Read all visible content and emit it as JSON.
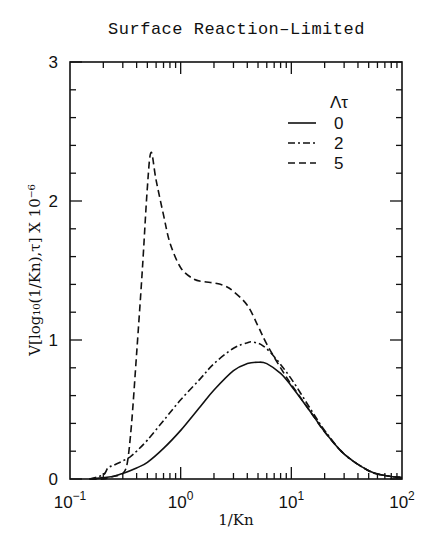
{
  "chart_data": {
    "type": "line",
    "title": "Surface Reaction–Limited",
    "xlabel": "1/Kn",
    "ylabel": "V[log₁₀(1/Kn),τ]  X  10⁻⁶",
    "xscale": "log",
    "xlim": [
      0.1,
      100
    ],
    "ylim": [
      0,
      3
    ],
    "x_ticks": [
      {
        "value": 0.1,
        "label_base": "10",
        "label_exp": "−1"
      },
      {
        "value": 1,
        "label_base": "10",
        "label_exp": "0"
      },
      {
        "value": 10,
        "label_base": "10",
        "label_exp": "1"
      },
      {
        "value": 100,
        "label_base": "10",
        "label_exp": "2"
      }
    ],
    "y_ticks": [
      0,
      1,
      2,
      3
    ],
    "y_minor_step": 0.2,
    "grid": false,
    "legend": {
      "title": "Λτ",
      "position": "upper right",
      "entries": [
        {
          "label": "0",
          "style": "solid"
        },
        {
          "label": "2",
          "style": "dashdot"
        },
        {
          "label": "5",
          "style": "dashed"
        }
      ]
    },
    "series": [
      {
        "name": "Λτ = 0",
        "style": "solid",
        "x": [
          0.15,
          0.2,
          0.25,
          0.3,
          0.4,
          0.5,
          0.7,
          1.0,
          1.5,
          2.0,
          3.0,
          4.0,
          5.0,
          6.0,
          8.0,
          10,
          15,
          20,
          30,
          50,
          70,
          100
        ],
        "y": [
          0.0,
          0.01,
          0.02,
          0.04,
          0.08,
          0.12,
          0.22,
          0.35,
          0.52,
          0.64,
          0.78,
          0.83,
          0.84,
          0.83,
          0.76,
          0.67,
          0.48,
          0.34,
          0.18,
          0.06,
          0.025,
          0.01
        ]
      },
      {
        "name": "Λτ = 2",
        "style": "dashdot",
        "x": [
          0.15,
          0.2,
          0.22,
          0.25,
          0.3,
          0.35,
          0.4,
          0.5,
          0.7,
          1.0,
          1.5,
          2.0,
          3.0,
          4.0,
          4.5,
          5.5,
          7.0,
          10,
          15,
          20,
          30,
          50,
          70,
          100
        ],
        "y": [
          0.0,
          0.03,
          0.08,
          0.1,
          0.13,
          0.16,
          0.2,
          0.28,
          0.42,
          0.57,
          0.72,
          0.83,
          0.94,
          0.98,
          0.985,
          0.96,
          0.88,
          0.72,
          0.5,
          0.35,
          0.18,
          0.06,
          0.025,
          0.01
        ]
      },
      {
        "name": "Λτ = 5",
        "style": "dashed",
        "x": [
          0.15,
          0.2,
          0.25,
          0.3,
          0.33,
          0.36,
          0.4,
          0.45,
          0.5,
          0.54,
          0.6,
          0.7,
          0.8,
          1.0,
          1.3,
          1.6,
          2.0,
          2.5,
          3.0,
          4.0,
          5.0,
          6.0,
          8.0,
          10,
          15,
          20,
          30,
          50,
          70,
          100
        ],
        "y": [
          0.0,
          0.0,
          0.02,
          0.04,
          0.12,
          0.4,
          0.9,
          1.5,
          2.1,
          2.35,
          2.15,
          1.9,
          1.7,
          1.52,
          1.44,
          1.42,
          1.41,
          1.39,
          1.35,
          1.25,
          1.1,
          0.97,
          0.8,
          0.68,
          0.48,
          0.34,
          0.18,
          0.06,
          0.025,
          0.01
        ]
      }
    ]
  }
}
